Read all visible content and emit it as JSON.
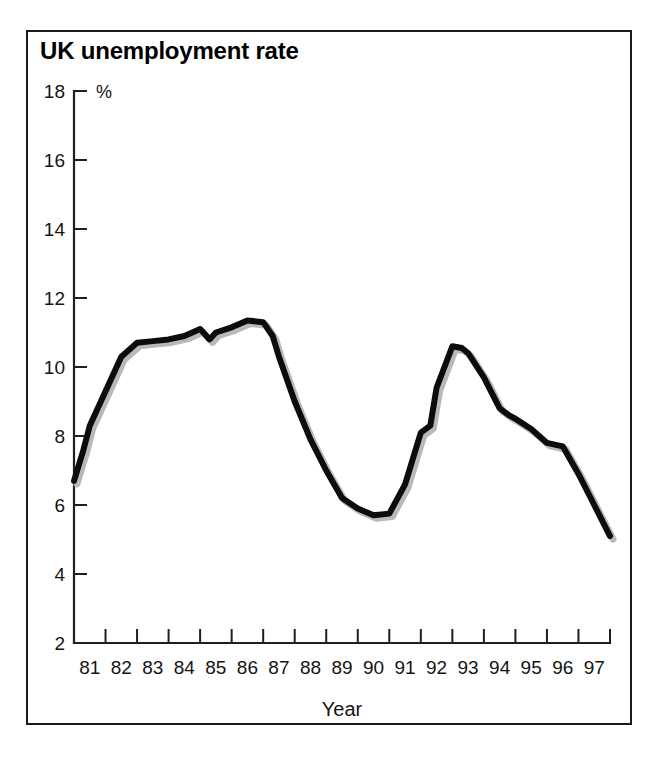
{
  "figure": {
    "title": "UK unemployment rate",
    "border_color": "#1a1a1a",
    "background": "#ffffff"
  },
  "chart_data": {
    "type": "line",
    "title": "UK unemployment rate",
    "xlabel": "Year",
    "ylabel": "%",
    "unit_label": "%",
    "xlim": [
      1980.5,
      1997.5
    ],
    "ylim": [
      2,
      18
    ],
    "grid": false,
    "legend": null,
    "line_color": "#0c0c0c",
    "y_ticks": [
      2,
      4,
      6,
      8,
      10,
      12,
      14,
      16,
      18
    ],
    "y_tick_labels": [
      "2",
      "4",
      "6",
      "8",
      "10",
      "12",
      "14",
      "16",
      "18"
    ],
    "x_ticks": [
      1980.5,
      1981.5,
      1982.5,
      1983.5,
      1984.5,
      1985.5,
      1986.5,
      1987.5,
      1988.5,
      1989.5,
      1990.5,
      1991.5,
      1992.5,
      1993.5,
      1994.5,
      1995.5,
      1996.5,
      1997.5
    ],
    "x_tick_labels": [
      "81",
      "82",
      "83",
      "84",
      "85",
      "86",
      "87",
      "88",
      "89",
      "90",
      "91",
      "92",
      "93",
      "94",
      "95",
      "96",
      "97"
    ],
    "x": [
      1980.5,
      1980.8,
      1981.0,
      1981.5,
      1982.0,
      1982.5,
      1983.0,
      1983.5,
      1984.0,
      1984.5,
      1984.8,
      1985.0,
      1985.5,
      1986.0,
      1986.5,
      1986.8,
      1987.0,
      1987.5,
      1988.0,
      1988.5,
      1989.0,
      1989.5,
      1990.0,
      1990.5,
      1991.0,
      1991.5,
      1991.8,
      1992.0,
      1992.5,
      1992.8,
      1993.0,
      1993.5,
      1994.0,
      1994.3,
      1994.5,
      1995.0,
      1995.5,
      1996.0,
      1996.5,
      1997.0,
      1997.5
    ],
    "y": [
      6.7,
      7.6,
      8.3,
      9.3,
      10.3,
      10.7,
      10.75,
      10.8,
      10.9,
      11.1,
      10.8,
      11.0,
      11.15,
      11.35,
      11.3,
      10.9,
      10.3,
      9.0,
      7.9,
      7.0,
      6.2,
      5.9,
      5.7,
      5.75,
      6.6,
      8.1,
      8.3,
      9.4,
      10.6,
      10.55,
      10.4,
      9.7,
      8.8,
      8.6,
      8.5,
      8.2,
      7.8,
      7.7,
      6.9,
      6.0,
      5.1
    ],
    "series": [
      {
        "name": "UK unemployment rate",
        "color": "#0c0c0c",
        "values": [
          6.7,
          7.6,
          8.3,
          9.3,
          10.3,
          10.7,
          10.75,
          10.8,
          10.9,
          11.1,
          10.8,
          11.0,
          11.15,
          11.35,
          11.3,
          10.9,
          10.3,
          9.0,
          7.9,
          7.0,
          6.2,
          5.9,
          5.7,
          5.75,
          6.6,
          8.1,
          8.3,
          9.4,
          10.6,
          10.55,
          10.4,
          9.7,
          8.8,
          8.6,
          8.5,
          8.2,
          7.8,
          7.7,
          6.9,
          6.0,
          5.1
        ]
      }
    ]
  }
}
